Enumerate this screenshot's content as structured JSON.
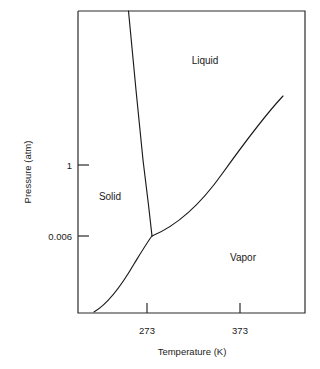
{
  "chart_data": {
    "type": "line",
    "title": "",
    "xlabel": "Temperature (K)",
    "ylabel": "Pressure (atm)",
    "grid": false,
    "legend": "none",
    "axis_scale": {
      "x": "linear",
      "y": "log"
    },
    "xlim": [
      173,
      473
    ],
    "ylim_labels": [
      "0.006",
      "1"
    ],
    "xticks": [
      {
        "label": "273",
        "value": 273,
        "px": 147
      },
      {
        "label": "373",
        "value": 373,
        "px": 240
      }
    ],
    "yticks": [
      {
        "label": "1",
        "value": 1,
        "px": 165
      },
      {
        "label": "0.006",
        "value": 0.006,
        "px": 236
      }
    ],
    "annotations": [
      {
        "text": "Solid",
        "x_px": 110,
        "y_px": 196
      },
      {
        "text": "Liquid",
        "x_px": 205,
        "y_px": 60
      },
      {
        "text": "Vapor",
        "x_px": 243,
        "y_px": 257
      }
    ],
    "special_points": [
      {
        "name": "triple-point",
        "temperature": 273.16,
        "pressure": 0.006,
        "x_px": 152,
        "y_px": 236
      },
      {
        "name": "critical-point",
        "temperature": 647,
        "pressure": 218,
        "x_px": 283,
        "y_px": 96
      }
    ],
    "series": [
      {
        "name": "fusion-curve",
        "description": "solid-liquid boundary, negative slope",
        "path": "M 128.5 11 L 136 90 L 143 160 L 148.5 205 L 152 236"
      },
      {
        "name": "vaporization-curve",
        "description": "liquid-vapor boundary, triple point to critical point",
        "path": "M 152 236 C 176 226 200 205 222 174 C 245 142 268 112 283 96"
      },
      {
        "name": "sublimation-curve",
        "description": "solid-vapor boundary, below triple point",
        "path": "M 94 312 C 106 305 120 288 134 264 C 142 251 148 241 152 236"
      }
    ],
    "plot_frame": {
      "left": 78,
      "top": 11,
      "right": 305,
      "bottom": 313
    }
  },
  "axes": {
    "x_title": "Temperature (K)",
    "y_title": "Pressure (atm)"
  },
  "ticks": {
    "x": [
      "273",
      "373"
    ],
    "y": [
      "1",
      "0.006"
    ]
  },
  "regions": {
    "solid": "Solid",
    "liquid": "Liquid",
    "vapor": "Vapor"
  },
  "colors": {
    "curve": "#1a1a1a",
    "frame": "#2b2b2b",
    "background": "#ffffff",
    "text": "#1a1a1a"
  }
}
